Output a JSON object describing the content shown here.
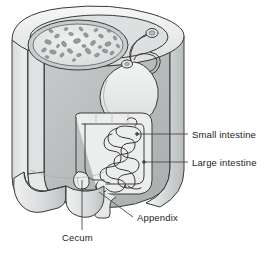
{
  "figure": {
    "type": "anatomical-illustration",
    "background_color": "#ffffff",
    "line_color": "#3a3a3a",
    "text_color": "#1d1d1d"
  },
  "labels": {
    "small_intestine": "Small intestine",
    "large_intestine": "Large intestine",
    "appendix": "Appendix",
    "cecum": "Cecum"
  },
  "leaders": [
    {
      "name": "small-intestine-leader",
      "from": [
        136,
        134
      ],
      "to": [
        188,
        134
      ],
      "marker": "dot"
    },
    {
      "name": "large-intestine-leader",
      "from": [
        143,
        162
      ],
      "to": [
        188,
        162
      ],
      "marker": "dot"
    },
    {
      "name": "appendix-leader",
      "from": [
        99,
        192
      ],
      "to": [
        133,
        217
      ],
      "marker": "none"
    },
    {
      "name": "cecum-leader",
      "from": [
        82,
        180
      ],
      "to": [
        82,
        230
      ],
      "marker": "none"
    }
  ],
  "palette": {
    "organ_fill": "#eceded",
    "organ_fill_shadow": "#d4d6d7",
    "cavity_fill": "#c3c6c7",
    "cavity_fill_dark": "#aeb2b3",
    "wall_light": "#f2f3f3",
    "wall_mid": "#d9dbdc",
    "wall_dark": "#bcbfc0",
    "speckle": "#9a9d9e",
    "outline": "#3a3a3a"
  },
  "structures": [
    {
      "name": "torso-cylinder",
      "label": "body wall cutaway"
    },
    {
      "name": "thoracic-oval",
      "label": "speckled cross-section cavity"
    },
    {
      "name": "esophagus",
      "label": "esophagus tube"
    },
    {
      "name": "stomach",
      "label": "stomach"
    },
    {
      "name": "large-intestine-frame",
      "label": "colon frame"
    },
    {
      "name": "small-intestine-coils",
      "label": "coiled small intestine"
    },
    {
      "name": "cecum-pouch",
      "label": "cecum"
    },
    {
      "name": "appendix-tip",
      "label": "appendix"
    },
    {
      "name": "rectum-outlet",
      "label": "rectum / outlet"
    },
    {
      "name": "leg-stumps",
      "label": "lower limb stumps"
    }
  ]
}
